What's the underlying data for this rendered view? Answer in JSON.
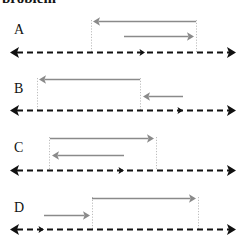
{
  "figure": {
    "caption_fragment": "problem",
    "width": 246,
    "height": 236,
    "background_color": "#ffffff",
    "baseline_color": "#111111",
    "arrow_color": "#8a8a8a",
    "boundary_color": "#bdbdbd",
    "axis_left_x": 10,
    "axis_right_x": 236
  },
  "panels": [
    {
      "id": "A",
      "label": "A",
      "label_x": 14,
      "label_y": 23,
      "baseline_y": 52,
      "boundaries": [
        {
          "name": "left-boundary",
          "x": 91,
          "y_top": 20,
          "y_bottom": 52
        },
        {
          "name": "right-boundary",
          "x": 196,
          "y_top": 20,
          "y_bottom": 52
        }
      ],
      "tick": {
        "name": "baseline-tick",
        "x": 145,
        "direction": "right"
      },
      "arrows": [
        {
          "name": "arrow-a-1",
          "x_start": 196,
          "x_end": 93,
          "y": 21,
          "direction": "left"
        },
        {
          "name": "arrow-a-2",
          "x_start": 124,
          "x_end": 194,
          "y": 36,
          "direction": "right"
        }
      ]
    },
    {
      "id": "B",
      "label": "B",
      "label_x": 14,
      "label_y": 82,
      "baseline_y": 110,
      "boundaries": [
        {
          "name": "left-boundary",
          "x": 37,
          "y_top": 78,
          "y_bottom": 110
        },
        {
          "name": "right-boundary",
          "x": 140,
          "y_top": 78,
          "y_bottom": 110
        }
      ],
      "tick": {
        "name": "baseline-tick",
        "x": 183,
        "direction": "right"
      },
      "arrows": [
        {
          "name": "arrow-b-1",
          "x_start": 140,
          "x_end": 39,
          "y": 79,
          "direction": "left"
        },
        {
          "name": "arrow-b-2",
          "x_start": 183,
          "x_end": 143,
          "y": 96,
          "direction": "left"
        }
      ]
    },
    {
      "id": "C",
      "label": "C",
      "label_x": 14,
      "label_y": 141,
      "baseline_y": 170,
      "boundaries": [
        {
          "name": "left-boundary",
          "x": 49,
          "y_top": 137,
          "y_bottom": 170
        },
        {
          "name": "right-boundary",
          "x": 156,
          "y_top": 137,
          "y_bottom": 170
        }
      ],
      "tick": {
        "name": "baseline-tick",
        "x": 124,
        "direction": "right"
      },
      "arrows": [
        {
          "name": "arrow-c-1",
          "x_start": 50,
          "x_end": 154,
          "y": 138,
          "direction": "right"
        },
        {
          "name": "arrow-c-2",
          "x_start": 124,
          "x_end": 52,
          "y": 155,
          "direction": "left"
        }
      ]
    },
    {
      "id": "D",
      "label": "D",
      "label_x": 14,
      "label_y": 201,
      "baseline_y": 229,
      "boundaries": [
        {
          "name": "left-boundary",
          "x": 92,
          "y_top": 197,
          "y_bottom": 229
        },
        {
          "name": "right-boundary",
          "x": 198,
          "y_top": 197,
          "y_bottom": 229
        }
      ],
      "tick": {
        "name": "baseline-tick",
        "x": 44,
        "direction": "right"
      },
      "arrows": [
        {
          "name": "arrow-d-1",
          "x_start": 92,
          "x_end": 196,
          "y": 198,
          "direction": "right"
        },
        {
          "name": "arrow-d-2",
          "x_start": 44,
          "x_end": 90,
          "y": 215,
          "direction": "right"
        }
      ]
    }
  ]
}
